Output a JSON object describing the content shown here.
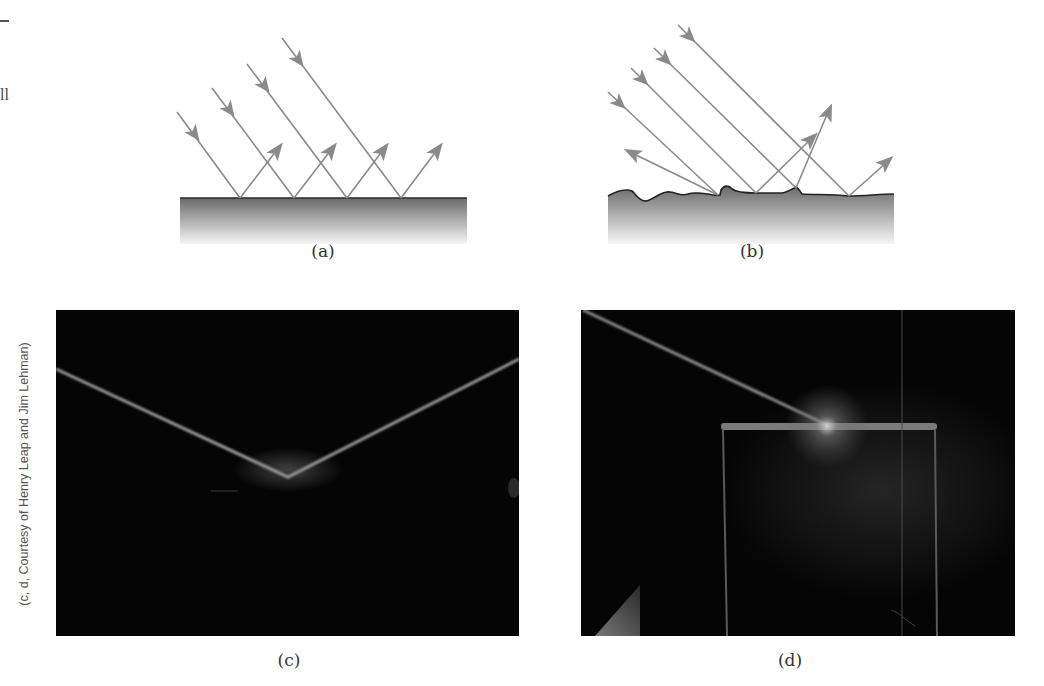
{
  "figure": {
    "margin_fragments": {
      "dash": "—",
      "text_ll": "ll"
    },
    "panels": [
      {
        "id": "a",
        "caption": "(a)",
        "description": "Specular reflection from a smooth surface: parallel incident rays reflect as parallel rays",
        "surface": "smooth",
        "incident_rays": 4,
        "reflected_rays": 4
      },
      {
        "id": "b",
        "caption": "(b)",
        "description": "Diffuse reflection from a rough surface: parallel incident rays reflect in various directions",
        "surface": "rough",
        "incident_rays": 4,
        "reflected_rays": 4
      },
      {
        "id": "c",
        "caption": "(c)",
        "description": "Photograph: light beam specularly reflecting from a smooth mirror surface (V-shape)"
      },
      {
        "id": "d",
        "caption": "(d)",
        "description": "Photograph: light beam striking a rough block surface and diffusely scattering"
      }
    ],
    "photo_credit": "(c, d, Courtesy of Henry Leap and Jim Lehman)",
    "colors": {
      "ray": "#8a8a8a",
      "surface_top": "#6e6e6e",
      "surface_bottom": "#f4f4f4",
      "surface_line": "#222222",
      "photo_bg": "#050505",
      "beam": "#9a9a9a"
    }
  }
}
